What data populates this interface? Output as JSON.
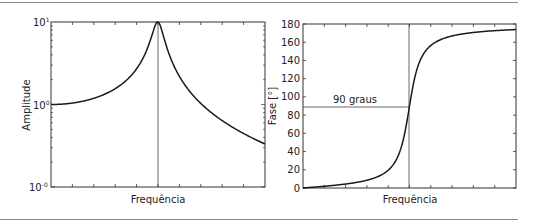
{
  "chart_data": [
    {
      "type": "line",
      "title": "",
      "xlabel": "Frequência",
      "ylabel": "Amplitude",
      "yscale": "log",
      "ylim": [
        0.1,
        10
      ],
      "ytick_labels": [
        "10⁻¹",
        "10⁰",
        "10¹"
      ],
      "xtick_labels": [],
      "grid": false,
      "legend": null,
      "annotations": [
        {
          "type": "vline",
          "at": "resonance frequency (peak)"
        }
      ],
      "series": [
        {
          "name": "Amplitude",
          "x_ratio": [
            0.0,
            0.2,
            0.4,
            0.6,
            0.8,
            0.9,
            0.95,
            1.0,
            1.05,
            1.1,
            1.2,
            1.4,
            1.6,
            1.8,
            2.0
          ],
          "values": [
            1.0,
            1.04,
            1.19,
            1.56,
            2.75,
            5.0,
            8.0,
            10.0,
            8.0,
            4.5,
            2.2,
            1.03,
            0.64,
            0.45,
            0.33
          ]
        }
      ]
    },
    {
      "type": "line",
      "title": "",
      "xlabel": "Frequência",
      "ylabel": "Fase [°]",
      "ylim": [
        0,
        180
      ],
      "yticks": [
        0,
        20,
        40,
        60,
        80,
        100,
        120,
        140,
        160,
        180
      ],
      "xtick_labels": [],
      "grid": false,
      "legend": null,
      "annotations": [
        {
          "type": "hline",
          "y": 90,
          "text": "90 graus"
        },
        {
          "type": "vline",
          "at": "resonance frequency"
        }
      ],
      "series": [
        {
          "name": "Fase",
          "x_ratio": [
            0.0,
            0.2,
            0.4,
            0.6,
            0.8,
            0.9,
            0.95,
            1.0,
            1.05,
            1.1,
            1.2,
            1.4,
            1.6,
            1.8,
            2.0
          ],
          "values": [
            0,
            1,
            3,
            5,
            12,
            25,
            44,
            90,
            136,
            152,
            164,
            170,
            172,
            174,
            175
          ]
        }
      ]
    }
  ],
  "left_plot": {
    "xlabel": "Frequência",
    "ylabel": "Amplitude",
    "ytick_top": "10",
    "ytick_top_exp": "1",
    "ytick_mid": "10",
    "ytick_mid_exp": "0",
    "ytick_bot": "10",
    "ytick_bot_exp": "-0"
  },
  "right_plot": {
    "xlabel": "Frequência",
    "ylabel": "Fase [°]",
    "yticks": [
      "0",
      "20",
      "40",
      "60",
      "80",
      "100",
      "120",
      "140",
      "160",
      "180"
    ],
    "annotation": "90 graus"
  },
  "colors": {
    "line": "#1a1a1a",
    "axis": "#333333",
    "separator": "#8a8a8a"
  }
}
